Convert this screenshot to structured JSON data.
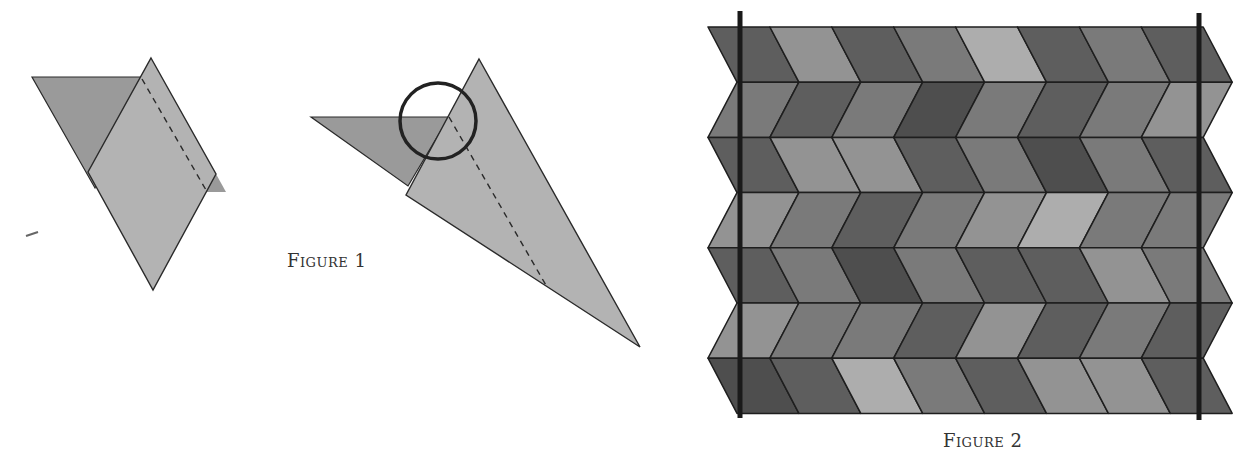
{
  "figure1": {
    "caption": "Figure 1",
    "caption_pos": [
      287,
      250
    ],
    "colors": {
      "back": "#9a9a9a",
      "front": "#b3b3b3",
      "stroke": "#2a2a2a"
    },
    "left_fold": {
      "back_triangle": [
        [
          32,
          77
        ],
        [
          142,
          77
        ],
        [
          95,
          188
        ]
      ],
      "front_rhombus": [
        [
          151,
          58
        ],
        [
          216,
          174
        ],
        [
          153,
          290
        ],
        [
          88,
          172
        ]
      ],
      "tail": [
        [
          206,
          178
        ],
        [
          216,
          174
        ],
        [
          226,
          192
        ],
        [
          206,
          192
        ]
      ],
      "dash": [
        [
          142,
          79
        ],
        [
          206,
          190
        ]
      ]
    },
    "right_fold": {
      "back_triangle": [
        [
          311,
          117
        ],
        [
          449,
          117
        ],
        [
          408,
          186
        ]
      ],
      "front_triangle": [
        [
          479,
          59
        ],
        [
          640,
          347
        ],
        [
          406,
          195
        ]
      ],
      "dash": [
        [
          449,
          117
        ],
        [
          547,
          287
        ]
      ],
      "circle": {
        "cx": 438,
        "cy": 121,
        "r": 38
      }
    },
    "stray_mark": [
      [
        26,
        236
      ],
      [
        38,
        232
      ]
    ]
  },
  "figure2": {
    "caption": "Figure 2",
    "caption_pos": [
      943,
      430
    ],
    "grid": {
      "left": 710,
      "top": 27,
      "col_width": 61.9,
      "row_height": 55.2,
      "shift": 29,
      "columns": 8,
      "bars": [
        {
          "x": 740,
          "y1": 11,
          "y2": 418
        },
        {
          "x": 1199,
          "y1": 13,
          "y2": 420
        }
      ]
    },
    "palette": {
      "k": "#4e4e4e",
      "d": "#5e5e5e",
      "m": "#7a7a7a",
      "l": "#939393",
      "x": "#adadad"
    },
    "rows": [
      {
        "dir": "right",
        "shades": [
          "d",
          "l",
          "d",
          "m",
          "x",
          "d",
          "m",
          "d"
        ]
      },
      {
        "dir": "left",
        "shades": [
          "m",
          "d",
          "m",
          "k",
          "m",
          "d",
          "m",
          "l"
        ]
      },
      {
        "dir": "right",
        "shades": [
          "d",
          "l",
          "l",
          "d",
          "m",
          "k",
          "m",
          "d"
        ]
      },
      {
        "dir": "left",
        "shades": [
          "l",
          "m",
          "d",
          "m",
          "l",
          "x",
          "m",
          "m"
        ]
      },
      {
        "dir": "right",
        "shades": [
          "d",
          "m",
          "k",
          "m",
          "d",
          "d",
          "l",
          "m"
        ]
      },
      {
        "dir": "left",
        "shades": [
          "l",
          "m",
          "m",
          "d",
          "l",
          "d",
          "m",
          "d"
        ]
      },
      {
        "dir": "right",
        "shades": [
          "k",
          "d",
          "x",
          "m",
          "d",
          "l",
          "l",
          "d"
        ]
      }
    ]
  }
}
